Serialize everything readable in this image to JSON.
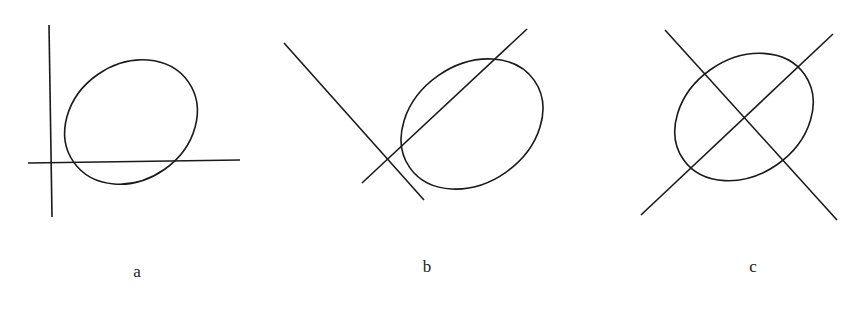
{
  "figure": {
    "panels": [
      {
        "id": "a",
        "label": "a",
        "description": "Ellipse with two perpendicular axes (vertical and horizontal) tangent-offset at lower-left",
        "ellipse": {
          "cx": 131,
          "cy": 122,
          "rx": 70,
          "ry": 58,
          "rotate": -35
        },
        "lines": [
          {
            "x1": 49,
            "y1": 25,
            "x2": 52,
            "y2": 217
          },
          {
            "x1": 28,
            "y1": 163,
            "x2": 240,
            "y2": 160
          }
        ],
        "label_pos": {
          "x": 137,
          "y": 262
        }
      },
      {
        "id": "b",
        "label": "b",
        "description": "Ellipse with two perpendicular diagonal lines intersecting outside the ellipse at lower-left",
        "ellipse": {
          "cx": 472,
          "cy": 124,
          "rx": 76,
          "ry": 59,
          "rotate": -35
        },
        "lines": [
          {
            "x1": 284,
            "y1": 43,
            "x2": 424,
            "y2": 200
          },
          {
            "x1": 362,
            "y1": 183,
            "x2": 527,
            "y2": 29
          }
        ],
        "label_pos": {
          "x": 427,
          "y": 257
        }
      },
      {
        "id": "c",
        "label": "c",
        "description": "Ellipse with two perpendicular diagonal lines intersecting at the ellipse center",
        "ellipse": {
          "cx": 744,
          "cy": 117,
          "rx": 74,
          "ry": 58,
          "rotate": -35
        },
        "lines": [
          {
            "x1": 665,
            "y1": 30,
            "x2": 837,
            "y2": 220
          },
          {
            "x1": 641,
            "y1": 215,
            "x2": 833,
            "y2": 34
          }
        ],
        "label_pos": {
          "x": 753,
          "y": 257
        }
      }
    ],
    "stroke_color": "#1a1a1a",
    "background": "#ffffff"
  }
}
